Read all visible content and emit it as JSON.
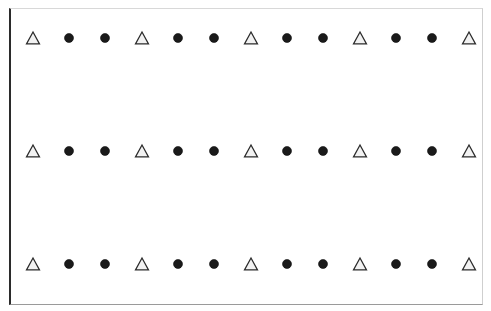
{
  "figure": {
    "title": "",
    "background_color": "#ffffff",
    "frame": {
      "border_color_left": "#2b2b2b",
      "border_color_top": "#d8d8d8",
      "border_color_right": "#cfcfcf",
      "border_color_bottom": "#9a9a9a",
      "fill_color": "#ffffff",
      "x": 9,
      "y": 8,
      "width": 474,
      "height": 297
    }
  },
  "chart_data": {
    "type": "scatter",
    "title": "",
    "subtitle": "",
    "xlabel": "",
    "ylabel": "",
    "xlim": [
      0,
      14
    ],
    "ylim": [
      0,
      4
    ],
    "grid": false,
    "legend": null,
    "xticklabels": [],
    "yticklabels": [],
    "annotations": [],
    "marker_styles": {
      "triangle": {
        "name": "open-triangle",
        "shape": "triangle-up",
        "fill": "#f2f2f2",
        "edge": "#2b2b2b",
        "size_px": 13
      },
      "circle": {
        "name": "filled-circle",
        "shape": "circle",
        "fill": "#1a1a1a",
        "edge": "#0d0d0d",
        "size_px": 9
      }
    },
    "pattern": [
      "triangle",
      "circle",
      "circle",
      "triangle",
      "circle",
      "circle",
      "triangle",
      "circle",
      "circle",
      "triangle",
      "circle",
      "circle",
      "triangle"
    ],
    "series": [
      {
        "name": "row-1",
        "y": 3,
        "y_px": 29,
        "x": [
          1,
          2,
          3,
          4,
          5,
          6,
          7,
          8,
          9,
          10,
          11,
          12,
          13
        ],
        "x_px": [
          22,
          58,
          94,
          131,
          167,
          203,
          240,
          276,
          312,
          349,
          385,
          421,
          458
        ],
        "markers": [
          "triangle",
          "circle",
          "circle",
          "triangle",
          "circle",
          "circle",
          "triangle",
          "circle",
          "circle",
          "triangle",
          "circle",
          "circle",
          "triangle"
        ]
      },
      {
        "name": "row-2",
        "y": 2,
        "y_px": 142,
        "x": [
          1,
          2,
          3,
          4,
          5,
          6,
          7,
          8,
          9,
          10,
          11,
          12,
          13
        ],
        "x_px": [
          22,
          58,
          94,
          131,
          167,
          203,
          240,
          276,
          312,
          349,
          385,
          421,
          458
        ],
        "markers": [
          "triangle",
          "circle",
          "circle",
          "triangle",
          "circle",
          "circle",
          "triangle",
          "circle",
          "circle",
          "triangle",
          "circle",
          "circle",
          "triangle"
        ]
      },
      {
        "name": "row-3",
        "y": 1,
        "y_px": 255,
        "x": [
          1,
          2,
          3,
          4,
          5,
          6,
          7,
          8,
          9,
          10,
          11,
          12,
          13
        ],
        "x_px": [
          22,
          58,
          94,
          131,
          167,
          203,
          240,
          276,
          312,
          349,
          385,
          421,
          458
        ],
        "markers": [
          "triangle",
          "circle",
          "circle",
          "triangle",
          "circle",
          "circle",
          "triangle",
          "circle",
          "circle",
          "triangle",
          "circle",
          "circle",
          "triangle"
        ]
      }
    ]
  }
}
